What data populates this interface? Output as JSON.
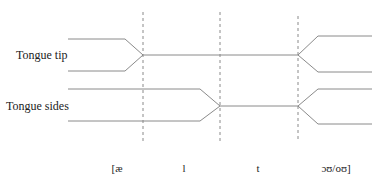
{
  "diagram": {
    "rows": [
      {
        "label": "Tongue tip"
      },
      {
        "label": "Tongue sides"
      }
    ],
    "segments": [
      "[æ",
      "l",
      "t",
      "ɔʊ/oʊ]"
    ],
    "colors": {
      "line": "#8a8a8a",
      "dashed": "#8a8a8a",
      "text": "#222222"
    }
  }
}
